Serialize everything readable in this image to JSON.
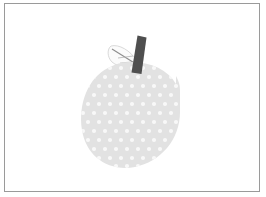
{
  "image": {
    "title": "Apple illustration",
    "width": 266,
    "height": 197,
    "background_color": "#ffffff",
    "frame": {
      "name": "border-frame",
      "stroke_color": "#9a9a9a",
      "stroke_width": 1,
      "x": 4,
      "y": 3,
      "width": 256,
      "height": 189
    },
    "subject": "apple",
    "style": "flat pastel clip-art, polka-dot texture"
  },
  "apple": {
    "body": {
      "name": "apple-body",
      "fill_color": "#e2e2e2",
      "center_x": 130,
      "center_y": 115,
      "radius_x": 49,
      "radius_y": 53,
      "bounds": {
        "left": 81,
        "top": 62,
        "right": 180,
        "bottom": 168
      }
    },
    "dots": {
      "name": "apple-dot-texture",
      "fill_color": "#f8f8f8",
      "radius": 2.1,
      "spacing_x": 11,
      "spacing_y": 9,
      "stagger": true,
      "count": 96
    },
    "stem": {
      "name": "apple-stem",
      "fill_color": "#4f4f4f",
      "top_x": 142,
      "top_y": 36,
      "bottom_x": 134,
      "bottom_y": 74,
      "width": 8,
      "tilt_degrees": 12
    },
    "leaf": {
      "name": "apple-leaf",
      "fill_color": "#fbfbfb",
      "stroke_color": "#cfcfcf",
      "vein_color": "#8c8c8c",
      "tip_x": 111,
      "tip_y": 45,
      "base_x": 137,
      "base_y": 66,
      "width": 30,
      "height": 24
    }
  },
  "palette": {
    "canvas": "#ffffff",
    "frame": "#9a9a9a",
    "body": "#e2e2e2",
    "dots": "#f8f8f8",
    "stem": "#4f4f4f",
    "leaf": "#fbfbfb",
    "leaf_vein": "#8c8c8c"
  }
}
